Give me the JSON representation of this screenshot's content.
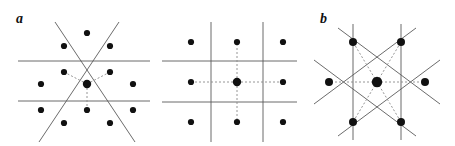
{
  "figure": {
    "width": 455,
    "height": 146,
    "background": "#ffffff",
    "line_color": "#5a5a5a",
    "bond_color": "#8a8a8a",
    "dot_color": "#111111"
  },
  "panels": [
    {
      "id": "a",
      "label": "a",
      "lattice": "triangular",
      "description": "Triangular lattice with three-fold site symmetry; two horizontal mirror lines and two diagonal mirror lines intersecting in an X.",
      "center": {
        "x": 87,
        "y": 84,
        "r": 4.2
      },
      "neighbor_count": 3,
      "sites": [
        {
          "x": 87,
          "y": 33,
          "r": 3.1
        },
        {
          "x": 64,
          "y": 46,
          "r": 3.1
        },
        {
          "x": 110,
          "y": 46,
          "r": 3.1
        },
        {
          "x": 64,
          "y": 72,
          "r": 3.1
        },
        {
          "x": 110,
          "y": 72,
          "r": 3.1
        },
        {
          "x": 41,
          "y": 84,
          "r": 3.1
        },
        {
          "x": 133,
          "y": 84,
          "r": 3.1
        },
        {
          "x": 41,
          "y": 110,
          "r": 3.1
        },
        {
          "x": 133,
          "y": 110,
          "r": 3.1
        },
        {
          "x": 87,
          "y": 110,
          "r": 3.1
        },
        {
          "x": 64,
          "y": 123,
          "r": 3.1
        },
        {
          "x": 110,
          "y": 123,
          "r": 3.1
        }
      ],
      "symmetry_lines": [
        {
          "name": "mirror-horizontal-upper",
          "x1": 18,
          "y1": 61,
          "x2": 150,
          "y2": 61
        },
        {
          "name": "mirror-horizontal-lower",
          "x1": 18,
          "y1": 101,
          "x2": 150,
          "y2": 101
        },
        {
          "name": "mirror-diagonal-right",
          "x1": 55,
          "y1": 22,
          "x2": 135,
          "y2": 142
        },
        {
          "name": "mirror-diagonal-left",
          "x1": 119,
          "y1": 22,
          "x2": 39,
          "y2": 142
        }
      ],
      "bonds": [
        {
          "name": "bond-up-left",
          "x1": 87,
          "y1": 84,
          "x2": 64,
          "y2": 72
        },
        {
          "name": "bond-up-right",
          "x1": 87,
          "y1": 84,
          "x2": 110,
          "y2": 72
        },
        {
          "name": "bond-down",
          "x1": 87,
          "y1": 84,
          "x2": 87,
          "y2": 110
        }
      ]
    },
    {
      "id": "b",
      "label": "b",
      "lattice": "square",
      "description": "Square lattice with four-fold site symmetry; two vertical and two horizontal mirror lines bounding the unit cell.",
      "center": {
        "x": 87,
        "y": 82,
        "r": 4.2
      },
      "neighbor_count": 4,
      "sites": [
        {
          "x": 41,
          "y": 42,
          "r": 3.1
        },
        {
          "x": 87,
          "y": 42,
          "r": 3.1
        },
        {
          "x": 133,
          "y": 42,
          "r": 3.1
        },
        {
          "x": 41,
          "y": 82,
          "r": 3.1
        },
        {
          "x": 133,
          "y": 82,
          "r": 3.1
        },
        {
          "x": 41,
          "y": 122,
          "r": 3.1
        },
        {
          "x": 87,
          "y": 122,
          "r": 3.1
        },
        {
          "x": 133,
          "y": 122,
          "r": 3.1
        }
      ],
      "symmetry_lines": [
        {
          "name": "mirror-vertical-left",
          "x1": 61,
          "y1": 22,
          "x2": 61,
          "y2": 142
        },
        {
          "name": "mirror-vertical-right",
          "x1": 113,
          "y1": 22,
          "x2": 113,
          "y2": 142
        },
        {
          "name": "mirror-horizontal-upper",
          "x1": 12,
          "y1": 61,
          "x2": 147,
          "y2": 61
        },
        {
          "name": "mirror-horizontal-lower",
          "x1": 12,
          "y1": 102,
          "x2": 147,
          "y2": 102
        }
      ],
      "bonds": [
        {
          "name": "bond-up",
          "x1": 87,
          "y1": 82,
          "x2": 87,
          "y2": 42
        },
        {
          "name": "bond-down",
          "x1": 87,
          "y1": 82,
          "x2": 87,
          "y2": 122
        },
        {
          "name": "bond-left",
          "x1": 87,
          "y1": 82,
          "x2": 41,
          "y2": 82
        },
        {
          "name": "bond-right",
          "x1": 87,
          "y1": 82,
          "x2": 133,
          "y2": 82
        }
      ]
    },
    {
      "id": "c",
      "label": "c",
      "lattice": "hexagonal",
      "description": "Hexagonal lattice with six-fold site symmetry; two vertical and four diagonal mirror lines forming a star through the six neighbours.",
      "center": {
        "x": 77,
        "y": 82,
        "r": 5.2
      },
      "neighbor_count": 6,
      "sites": [
        {
          "x": 53,
          "y": 42,
          "r": 4.0
        },
        {
          "x": 101,
          "y": 42,
          "r": 4.0
        },
        {
          "x": 29,
          "y": 82,
          "r": 4.0
        },
        {
          "x": 125,
          "y": 82,
          "r": 4.0
        },
        {
          "x": 53,
          "y": 122,
          "r": 4.0
        },
        {
          "x": 101,
          "y": 122,
          "r": 4.0
        }
      ],
      "symmetry_lines": [
        {
          "name": "mirror-vertical-left",
          "x1": 53,
          "y1": 24,
          "x2": 53,
          "y2": 140
        },
        {
          "name": "mirror-vertical-right",
          "x1": 101,
          "y1": 24,
          "x2": 101,
          "y2": 140
        },
        {
          "name": "mirror-diagonal-upper-left",
          "x1": 14,
          "y1": 60,
          "x2": 116,
          "y2": 136
        },
        {
          "name": "mirror-diagonal-upper-right",
          "x1": 140,
          "y1": 60,
          "x2": 38,
          "y2": 136
        },
        {
          "name": "mirror-diagonal-lower-left",
          "x1": 14,
          "y1": 104,
          "x2": 116,
          "y2": 28
        },
        {
          "name": "mirror-diagonal-lower-right",
          "x1": 140,
          "y1": 104,
          "x2": 38,
          "y2": 28
        }
      ],
      "bonds": [
        {
          "name": "bond-upper-left",
          "x1": 77,
          "y1": 82,
          "x2": 53,
          "y2": 42
        },
        {
          "name": "bond-upper-right",
          "x1": 77,
          "y1": 82,
          "x2": 101,
          "y2": 42
        },
        {
          "name": "bond-left",
          "x1": 77,
          "y1": 82,
          "x2": 29,
          "y2": 82
        },
        {
          "name": "bond-right",
          "x1": 77,
          "y1": 82,
          "x2": 125,
          "y2": 82
        },
        {
          "name": "bond-lower-left",
          "x1": 77,
          "y1": 82,
          "x2": 53,
          "y2": 122
        },
        {
          "name": "bond-lower-right",
          "x1": 77,
          "y1": 82,
          "x2": 101,
          "y2": 122
        }
      ]
    }
  ]
}
